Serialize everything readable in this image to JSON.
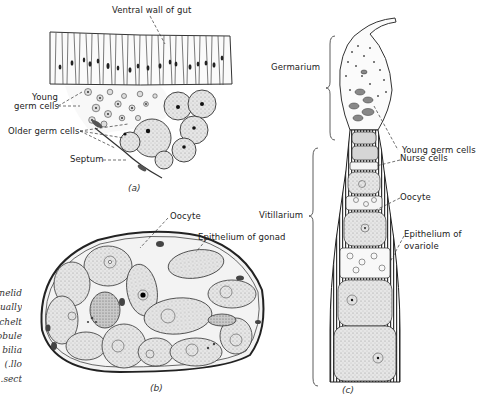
{
  "figure": {
    "panels": [
      {
        "id": "a",
        "label": "(a)",
        "labels": {
          "ventral_wall": "Ventral wall of gut",
          "young_germ_cells": "Young\ngerm cells",
          "young_line1": "Young",
          "young_line2": "germ cells",
          "older_germ_cells": "Older germ cells",
          "septum": "Septum"
        }
      },
      {
        "id": "b",
        "label": "(b)",
        "labels": {
          "oocyte": "Oocyte",
          "epithelium": "Epithelium of gonad"
        }
      },
      {
        "id": "c",
        "label": "(c)",
        "labels": {
          "germarium": "Germarium",
          "young_germ_cells": "Young germ cells",
          "nurse_cells": "Nurse cells",
          "vitillarium": "Vitillarium",
          "oocyte": "Oocyte",
          "epithelium_line1": "Epithelium of",
          "epithelium_line2": "ovariole"
        }
      }
    ],
    "caption_fragments": [
      "nelid",
      "ually",
      "chelt",
      "obule",
      "bilia",
      "llo.)",
      "sect."
    ]
  }
}
